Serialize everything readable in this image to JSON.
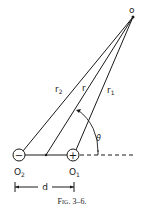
{
  "diagram": {
    "type": "dipole-geometry",
    "point": {
      "label": "o",
      "x": 133,
      "y": 17
    },
    "charges": [
      {
        "id": "negative",
        "sign": "−",
        "label_main": "O",
        "label_sub": "2",
        "x": 19,
        "y": 155
      },
      {
        "id": "positive",
        "sign": "+",
        "label_main": "O",
        "label_sub": "1",
        "x": 73,
        "y": 155
      }
    ],
    "center": {
      "x": 46,
      "y": 155
    },
    "distances": [
      {
        "name": "r2",
        "main": "r",
        "sub": "2"
      },
      {
        "name": "r",
        "main": "r",
        "sub": ""
      },
      {
        "name": "r1",
        "main": "r",
        "sub": "1"
      }
    ],
    "angle_label": "θ",
    "separation_label": "d",
    "caption": "Fig. 3–6."
  }
}
